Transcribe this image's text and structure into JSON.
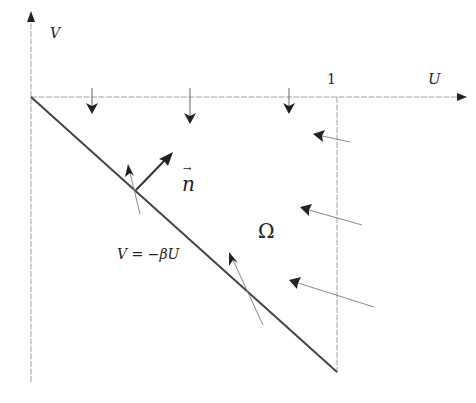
{
  "diagram": {
    "axes": {
      "v_label": "V",
      "u_label": "U",
      "tick_label_one": "1"
    },
    "labels": {
      "normal_vector": "n",
      "normal_vector_arrow": "→",
      "region": "Ω",
      "boundary_equation": "V = −βU"
    },
    "colors": {
      "axis": "#9a9a9a",
      "boundary": "#444444",
      "arrow": "#222222",
      "thin_arrow_shaft": "#8a8a8a",
      "text": "#222222"
    }
  }
}
